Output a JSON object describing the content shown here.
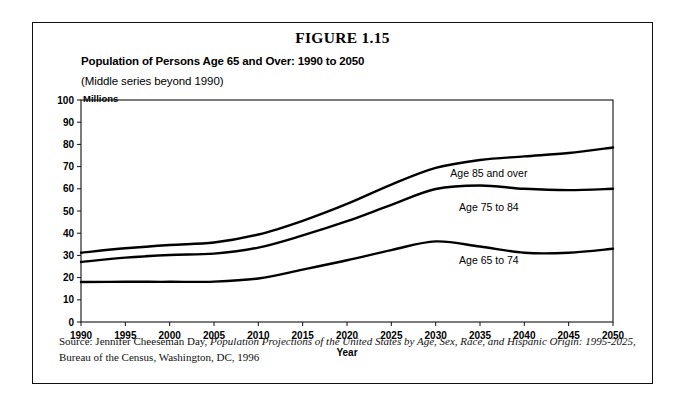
{
  "figure": {
    "number_label": "FIGURE 1.15",
    "title": "Population of Persons Age 65 and Over: 1990 to 2050",
    "subtitle": "(Middle series beyond 1990)",
    "units_label": "Millions"
  },
  "source": {
    "line1_prefix": "Source: Jennifer Cheeseman Day, ",
    "line1_italic": "Population Projections of the United States by Age, Sex, Race, and Hispanic Origin: 1995-2025",
    "line1_suffix": ",",
    "line2": "Bureau of the Census, Washington, DC, 1996"
  },
  "chart_data": {
    "type": "line",
    "title": "Population of Persons Age 65 and Over: 1990 to 2050",
    "subtitle": "(Middle series beyond 1990)",
    "xlabel": "Year",
    "ylabel": "Millions",
    "xlim": [
      1990,
      2050
    ],
    "ylim": [
      0,
      100
    ],
    "grid": false,
    "legend_position": "inline-right",
    "x": [
      1990,
      1995,
      2000,
      2005,
      2010,
      2015,
      2020,
      2025,
      2030,
      2035,
      2040,
      2045,
      2050
    ],
    "xticks": [
      "1990",
      "1995",
      "2000",
      "2005",
      "2010",
      "2015",
      "2020",
      "2025",
      "2030",
      "2035",
      "2040",
      "2045",
      "2050"
    ],
    "yticks": [
      "0",
      "10",
      "20",
      "30",
      "40",
      "50",
      "60",
      "70",
      "80",
      "90",
      "100"
    ],
    "series": [
      {
        "name": "Age 85 and over",
        "label": "Age 85 and over",
        "label_x": 2036,
        "label_y": 65.5,
        "values": [
          31.2,
          33.2,
          34.7,
          35.8,
          39.4,
          45.6,
          53.2,
          61.9,
          69.4,
          73.0,
          74.6,
          76.1,
          78.6
        ]
      },
      {
        "name": "Age 75 to 84",
        "label": "Age 75 to 84",
        "label_x": 2036,
        "label_y": 50.0,
        "values": [
          27.0,
          29.0,
          30.2,
          30.8,
          33.5,
          39.0,
          45.4,
          52.8,
          59.9,
          61.5,
          60.0,
          59.4,
          60.0
        ]
      },
      {
        "name": "Age 65 to 74",
        "label": "Age 65 to 74",
        "label_x": 2036,
        "label_y": 26.0,
        "values": [
          18.0,
          18.1,
          18.1,
          18.2,
          19.6,
          23.6,
          27.8,
          32.4,
          36.3,
          34.0,
          31.2,
          31.2,
          33.0
        ]
      }
    ]
  }
}
